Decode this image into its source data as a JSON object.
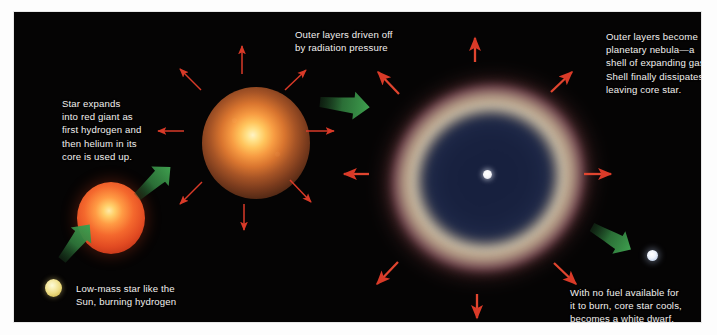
{
  "figure": {
    "background_color": "#050404",
    "text_color": "#f2f0ee"
  },
  "captions": {
    "red_giant": "Star expands\ninto red giant as\nfirst hydrogen and\nthen helium in its\ncore is used up.",
    "driven_off": "Outer layers driven off\nby radiation pressure",
    "nebula": "Outer layers become\nplanetary nebula—a\nshell of expanding gas.\nShell finally dissipates,\nleaving core star.",
    "low_mass": "Low-mass star like the\nSun, burning hydrogen",
    "white_dwarf": "With no fuel available for\nit to burn, core star cools,\nbecomes a white dwarf."
  },
  "objects": [
    {
      "name": "low-mass-star",
      "label": "Low-mass star like the Sun, burning hydrogen",
      "stage": 1,
      "color": "#eedd84",
      "center": [
        39,
        276
      ],
      "radius": 9
    },
    {
      "name": "red-giant-star",
      "label": "Red giant",
      "stage": 2,
      "color": "#f4682d",
      "center": [
        97,
        206
      ],
      "radius": 35
    },
    {
      "name": "expanding-star",
      "label": "Star with outer layers driven off by radiation pressure",
      "stage": 3,
      "color": "#f79b42",
      "center": [
        242,
        131
      ],
      "radius": 54
    },
    {
      "name": "planetary-nebula",
      "label": "Planetary nebula — shell of expanding gas",
      "stage": 4,
      "color": "#bda88f",
      "center": [
        474,
        166
      ],
      "radius": 110
    },
    {
      "name": "white-dwarf-star",
      "label": "White dwarf",
      "stage": 5,
      "color": "#eef3fb",
      "center": [
        638,
        243
      ],
      "radius": 6
    }
  ],
  "arrows": {
    "expansion_color": "#d93a28",
    "progression_color": "#2f7a3c",
    "expansion_note": "Red arrows show outer layers expanding radially outward",
    "progression_note": "Green arrows show progression from one stage to the next"
  }
}
